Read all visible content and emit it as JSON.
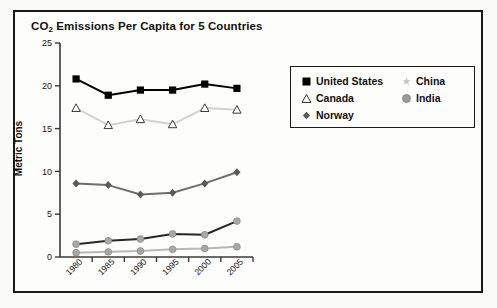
{
  "figure": {
    "title_main": "CO",
    "title_sub": "2",
    "title_rest": " Emissions Per Capita for 5 Countries",
    "title_full": "CO2 Emissions Per Capita for 5 Countries",
    "ylabel": "Metric Tons"
  },
  "legend": {
    "left": [
      {
        "label": "United States",
        "marker": "filled-square",
        "color": "#000000"
      },
      {
        "label": "Canada",
        "marker": "open-triangle",
        "color": "#ffffff"
      },
      {
        "label": "Norway",
        "marker": "filled-diamond",
        "color": "#595959"
      }
    ],
    "right": [
      {
        "label": "China",
        "marker": "star",
        "color": "#c4c4c4"
      },
      {
        "label": "India",
        "marker": "filled-circle",
        "color": "#9b9b9b"
      }
    ]
  },
  "chart_data": {
    "type": "line",
    "title": "CO2 Emissions Per Capita for 5 Countries",
    "xlabel": "",
    "ylabel": "Metric Tons",
    "categories": [
      "1980",
      "1985",
      "1990",
      "1995",
      "2000",
      "2005"
    ],
    "x": [
      1980,
      1985,
      1990,
      1995,
      2000,
      2005
    ],
    "ylim": [
      0,
      25
    ],
    "yticks": [
      0,
      5,
      10,
      15,
      20,
      25
    ],
    "ytick_labels": [
      "0",
      "5",
      "10",
      "15",
      "20",
      "25"
    ],
    "xtick_labels": [
      "1980",
      "1985",
      "1990",
      "1995",
      "2000",
      "2005"
    ],
    "xtick_rotation": 45,
    "grid": false,
    "legend_position": "right",
    "series": [
      {
        "name": "United States",
        "values": [
          20.8,
          18.9,
          19.5,
          19.5,
          20.2,
          19.7
        ],
        "color": "#000000",
        "line_color": "#000000",
        "marker": "filled-square"
      },
      {
        "name": "Canada",
        "values": [
          17.4,
          15.4,
          16.1,
          15.5,
          17.4,
          17.2
        ],
        "color": "#ffffff",
        "line_color": "#d2d2d2",
        "marker": "open-triangle"
      },
      {
        "name": "Norway",
        "values": [
          8.6,
          8.4,
          7.3,
          7.5,
          8.6,
          9.9
        ],
        "color": "#595959",
        "line_color": "#6e6e6e",
        "marker": "filled-diamond"
      },
      {
        "name": "China",
        "values": [
          1.5,
          1.9,
          2.1,
          2.7,
          2.6,
          4.2
        ],
        "color": "#a8a8a8",
        "line_color": "#262626",
        "marker": "filled-circle"
      },
      {
        "name": "India",
        "values": [
          0.5,
          0.6,
          0.7,
          0.9,
          1.0,
          1.2
        ],
        "color": "#a8a8a8",
        "line_color": "#b8b8b8",
        "marker": "filled-circle"
      }
    ]
  }
}
